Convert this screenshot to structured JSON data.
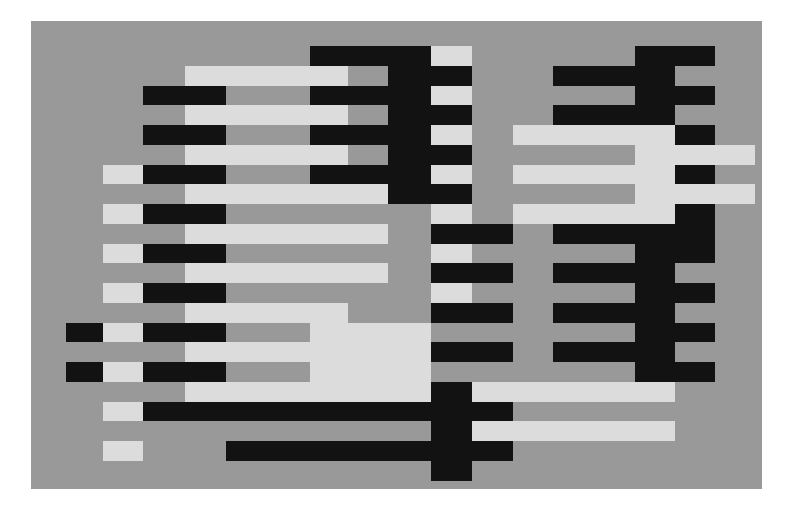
{
  "artwork": {
    "description": "Abstract geometric composition of interlocking black and off-white horizontal bars on a mid-gray ground",
    "colors": {
      "ground": "#999999",
      "dark": "#121212",
      "light": "#dcdcdc",
      "margin": "#ffffff"
    }
  }
}
